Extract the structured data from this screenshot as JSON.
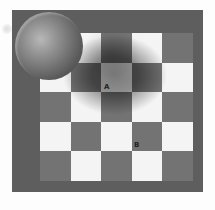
{
  "image": {
    "subject": "checker shadow illusion",
    "colors": {
      "background": "#fdfdfd",
      "frame": "#5e5e5e",
      "dark_tile": "#737373",
      "light_tile": "#f4f4f4",
      "sphere": "#6a6a6a"
    },
    "board": {
      "rows": 5,
      "cols": 5,
      "cells": [
        [
          "dark",
          "light",
          "dark",
          "light",
          "dark"
        ],
        [
          "light",
          "dark",
          "light",
          "dark",
          "light"
        ],
        [
          "dark",
          "light",
          "dark",
          "light",
          "dark"
        ],
        [
          "light",
          "dark",
          "light",
          "dark",
          "light"
        ],
        [
          "dark",
          "light",
          "dark",
          "light",
          "dark"
        ]
      ]
    },
    "labels": [
      {
        "text": "A",
        "row": 1,
        "col": 2
      },
      {
        "text": "B",
        "row": 3,
        "col": 3
      }
    ]
  }
}
